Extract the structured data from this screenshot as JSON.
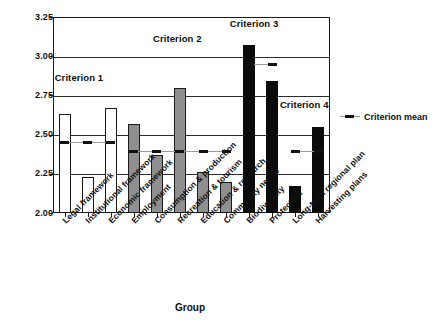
{
  "chart_data": {
    "type": "bar",
    "title": "",
    "xlabel": "Group",
    "ylabel": "",
    "ylim": [
      2.0,
      3.25
    ],
    "yticks": [
      "2.00",
      "2.25",
      "2.50",
      "2.75",
      "3.00",
      "3.25"
    ],
    "grid": true,
    "legend_position": "right",
    "categories": [
      "Legal framework",
      "Institutional framework",
      "Economic framework",
      "Employment",
      "Consumption & production",
      "Recreation & tourism",
      "Education & research",
      "Community needs",
      "Biodiversity",
      "Protection",
      "Long-term regional plan",
      "Harvesting plans"
    ],
    "values": [
      2.63,
      2.23,
      2.67,
      2.57,
      2.37,
      2.8,
      2.26,
      2.2,
      3.07,
      2.84,
      2.17,
      2.55
    ],
    "bar_styles": [
      "white",
      "white",
      "white",
      "gray",
      "gray",
      "gray",
      "gray",
      "gray",
      "black",
      "black",
      "black",
      "black"
    ],
    "series": [
      {
        "name": "Group score",
        "values": [
          2.63,
          2.23,
          2.67,
          2.57,
          2.37,
          2.8,
          2.26,
          2.2,
          3.07,
          2.84,
          2.17,
          2.55
        ]
      }
    ],
    "criterion_groups": [
      {
        "label": "Criterion 1",
        "first_index": 0,
        "last_index": 2,
        "mean": 2.45
      },
      {
        "label": "Criterion 2",
        "first_index": 3,
        "last_index": 7,
        "mean": 2.39
      },
      {
        "label": "Criterion 3",
        "first_index": 8,
        "last_index": 9,
        "mean": 2.95
      },
      {
        "label": "Criterion 4",
        "first_index": 10,
        "last_index": 11,
        "mean": 2.39
      }
    ],
    "legend_entries": [
      "Criterion mean"
    ],
    "colors": {
      "bar_white": "#ffffff",
      "bar_gray": "#8f8f8f",
      "bar_black": "#0b0b0b",
      "axis": "#1a1a1a",
      "mean_line": "#9a9a9a"
    },
    "annotations": [
      {
        "text": "Criterion 1"
      },
      {
        "text": "Criterion 2"
      },
      {
        "text": "Criterion 3"
      },
      {
        "text": "Criterion 4"
      }
    ]
  },
  "legend": {
    "criterion_mean_label": "Criterion mean"
  },
  "axes": {
    "x_title": "Group"
  }
}
